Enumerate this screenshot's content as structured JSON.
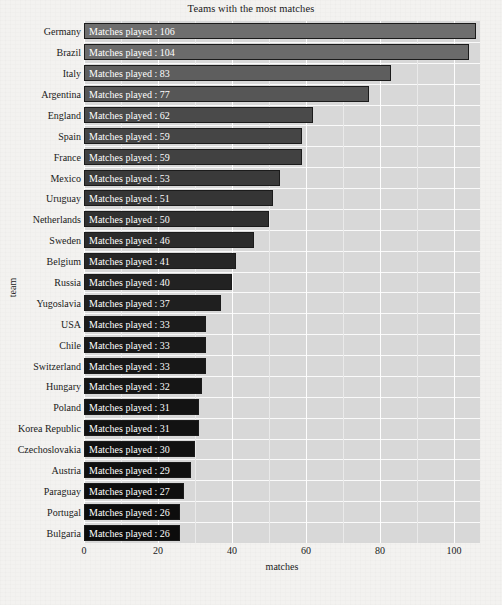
{
  "chart_data": {
    "type": "bar",
    "orientation": "horizontal",
    "title": "Teams with the most matches",
    "xlabel": "matches",
    "ylabel": "team",
    "categories": [
      "Germany",
      "Brazil",
      "Italy",
      "Argentina",
      "England",
      "Spain",
      "France",
      "Mexico",
      "Uruguay",
      "Netherlands",
      "Sweden",
      "Belgium",
      "Russia",
      "Yugoslavia",
      "USA",
      "Chile",
      "Switzerland",
      "Hungary",
      "Poland",
      "Korea Republic",
      "Czechoslovakia",
      "Austria",
      "Paraguay",
      "Portugal",
      "Bulgaria"
    ],
    "values": [
      106,
      104,
      83,
      77,
      62,
      59,
      59,
      53,
      51,
      50,
      46,
      41,
      40,
      37,
      33,
      33,
      33,
      32,
      31,
      31,
      30,
      29,
      27,
      26,
      26
    ],
    "bar_labels": [
      "Matches played  : 106",
      "Matches played  : 104",
      "Matches played  : 83",
      "Matches played  : 77",
      "Matches played  : 62",
      "Matches played  : 59",
      "Matches played  : 59",
      "Matches played  : 53",
      "Matches played  : 51",
      "Matches played  : 50",
      "Matches played  : 46",
      "Matches played  : 41",
      "Matches played  : 40",
      "Matches played  : 37",
      "Matches played  : 33",
      "Matches played  : 33",
      "Matches played  : 33",
      "Matches played  : 32",
      "Matches played  : 31",
      "Matches played  : 31",
      "Matches played  : 30",
      "Matches played  : 29",
      "Matches played  : 27",
      "Matches played  : 26",
      "Matches played  : 26"
    ],
    "bar_colors": [
      "#6e6e6e",
      "#6b6b6b",
      "#5e5e5e",
      "#565656",
      "#4a4a4a",
      "#454545",
      "#414141",
      "#3a3a3a",
      "#353535",
      "#303030",
      "#2b2b2b",
      "#262626",
      "#222222",
      "#1f1f1f",
      "#1b1b1b",
      "#191919",
      "#171717",
      "#151515",
      "#131313",
      "#121212",
      "#111111",
      "#101010",
      "#0e0e0e",
      "#0d0d0d",
      "#0c0c0c"
    ],
    "xticks": [
      0,
      20,
      40,
      60,
      80,
      100
    ],
    "xlim": [
      0,
      107
    ],
    "grid": true,
    "legend": "none",
    "panel_color": "#d8d8d8",
    "gridline_color": "#fdfdfd",
    "label_text_color": "#ffffff"
  }
}
